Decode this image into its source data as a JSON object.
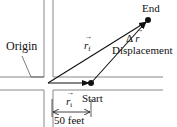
{
  "diagram": {
    "labels": {
      "origin": "Origin",
      "end": "End",
      "start": "Start",
      "displacement": "Displacement",
      "delta_r_symbol": "Δ",
      "delta_r_var": "r",
      "r_final_var": "r",
      "r_final_sub": "f",
      "r_initial_var": "r",
      "r_initial_sub": "i",
      "distance": "50 feet"
    },
    "points": {
      "origin": [
        48,
        83
      ],
      "start": [
        91,
        83
      ],
      "end": [
        148,
        20
      ]
    },
    "colors": {
      "line": "#111111",
      "street": "#888888",
      "background": "#ffffff"
    }
  }
}
